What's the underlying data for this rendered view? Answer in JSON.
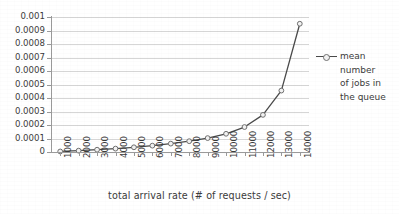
{
  "chart_data": {
    "type": "line",
    "title": "",
    "xlabel": "total arrival rate (# of requests / sec)",
    "ylabel": "",
    "xlim": [
      500,
      14500
    ],
    "ylim": [
      0,
      0.001
    ],
    "grid": true,
    "legend_position": "right",
    "x_tick_labels": [
      "1000",
      "2000",
      "3000",
      "4000",
      "5000",
      "6000",
      "7000",
      "8000",
      "9000",
      "10000",
      "11000",
      "12000",
      "13000",
      "14000"
    ],
    "y_tick_labels": [
      "0",
      "0.0001",
      "0.0002",
      "0.0003",
      "0.0004",
      "0.0005",
      "0.0006",
      "0.0007",
      "0.0008",
      "0.0009",
      "0.001"
    ],
    "x": [
      1000,
      2000,
      3000,
      4000,
      5000,
      6000,
      7000,
      8000,
      9000,
      10000,
      11000,
      12000,
      13000,
      14000
    ],
    "categories": [
      "1000",
      "2000",
      "3000",
      "4000",
      "5000",
      "6000",
      "7000",
      "8000",
      "9000",
      "10000",
      "11000",
      "12000",
      "13000",
      "14000"
    ],
    "series": [
      {
        "name": "mean number of jobs in the queue",
        "color": "#4a4a4a",
        "marker": "circle",
        "values": [
          4e-06,
          1e-05,
          1.7e-05,
          2.5e-05,
          3.5e-05,
          4.7e-05,
          6.2e-05,
          8e-05,
          0.000103,
          0.000135,
          0.000185,
          0.000275,
          0.000455,
          0.00095
        ]
      }
    ]
  },
  "axis": {
    "x_title": "total arrival rate (# of requests / sec)"
  },
  "legend": {
    "series_name": "mean number of jobs in the queue",
    "lines": [
      "mean",
      "number",
      "of jobs in",
      "the queue"
    ]
  },
  "colors": {
    "series": "#4a4a4a",
    "gridline": "#d6d6d6",
    "axis": "#9a9a9a",
    "marker_fill": "#f2f2f2",
    "marker_stroke": "#6f6f6f",
    "text": "#3b3b3b",
    "background": "#ffffff"
  }
}
